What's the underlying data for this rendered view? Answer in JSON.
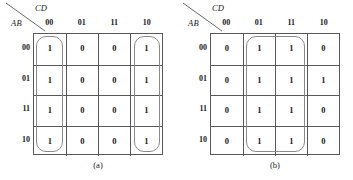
{
  "figure": {
    "type": "karnaugh-map-pair",
    "maps": [
      {
        "id": "a",
        "caption": "(a)",
        "corner": {
          "top_right_label": "CD",
          "bottom_left_label": "AB"
        },
        "column_headers": [
          "00",
          "01",
          "11",
          "10"
        ],
        "row_headers": [
          "00",
          "01",
          "11",
          "10"
        ],
        "cells": [
          [
            "1",
            "0",
            "0",
            "1"
          ],
          [
            "1",
            "0",
            "0",
            "1"
          ],
          [
            "1",
            "0",
            "0",
            "1"
          ],
          [
            "1",
            "0",
            "0",
            "1"
          ]
        ],
        "groups": [
          {
            "name": "group-column-00",
            "col_start": 0,
            "col_span": 1,
            "row_start": 0,
            "row_span": 4
          },
          {
            "name": "group-column-10",
            "col_start": 3,
            "col_span": 1,
            "row_start": 0,
            "row_span": 4
          }
        ]
      },
      {
        "id": "b",
        "caption": "(b)",
        "corner": {
          "top_right_label": "CD",
          "bottom_left_label": "AB"
        },
        "column_headers": [
          "00",
          "01",
          "11",
          "10"
        ],
        "row_headers": [
          "00",
          "01",
          "11",
          "10"
        ],
        "cells": [
          [
            "0",
            "1",
            "1",
            "0"
          ],
          [
            "0",
            "1",
            "1",
            "1"
          ],
          [
            "0",
            "1",
            "1",
            "0"
          ],
          [
            "0",
            "1",
            "1",
            "0"
          ]
        ],
        "groups": [
          {
            "name": "group-columns-01-11",
            "col_start": 1,
            "col_span": 2,
            "row_start": 0,
            "row_span": 4
          }
        ]
      }
    ],
    "colors": {
      "grid_line": "#58585a",
      "group_line": "#8a8a8d",
      "text": "#1a1a1a",
      "background": "#ffffff"
    }
  }
}
